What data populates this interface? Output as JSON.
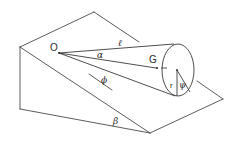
{
  "figure": {
    "stroke_color": "#4a4a4a",
    "background": "#ffffff"
  },
  "labels": {
    "apex": "O",
    "slant_length": "ℓ",
    "half_angle": "α",
    "center_of_mass": "G",
    "rolling_angle": "ϕ",
    "base_radius": "r",
    "base_angle": "ψ",
    "incline_angle": "β"
  }
}
